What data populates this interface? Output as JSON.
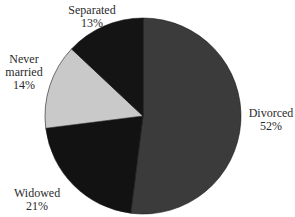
{
  "chart_data": {
    "type": "pie",
    "title": "",
    "start_angle_deg": 0,
    "direction": "clockwise",
    "slices": [
      {
        "label": "Divorced",
        "value": 52,
        "display": "52%",
        "color": "#3b3b3b"
      },
      {
        "label": "Widowed",
        "value": 21,
        "display": "21%",
        "color": "#121212"
      },
      {
        "label": "Never married",
        "value": 14,
        "display": "14%",
        "color": "#c9c9c9"
      },
      {
        "label": "Separated",
        "value": 13,
        "display": "13%",
        "color": "#141414"
      }
    ],
    "legend": "none (labels placed outside slices)"
  },
  "labels": {
    "separated": {
      "line1": "Separated",
      "pct": "13%"
    },
    "never_married": {
      "line1": "Never",
      "line2": "married",
      "pct": "14%"
    },
    "widowed": {
      "line1": "Widowed",
      "pct": "21%"
    },
    "divorced": {
      "line1": "Divorced",
      "pct": "52%"
    }
  }
}
